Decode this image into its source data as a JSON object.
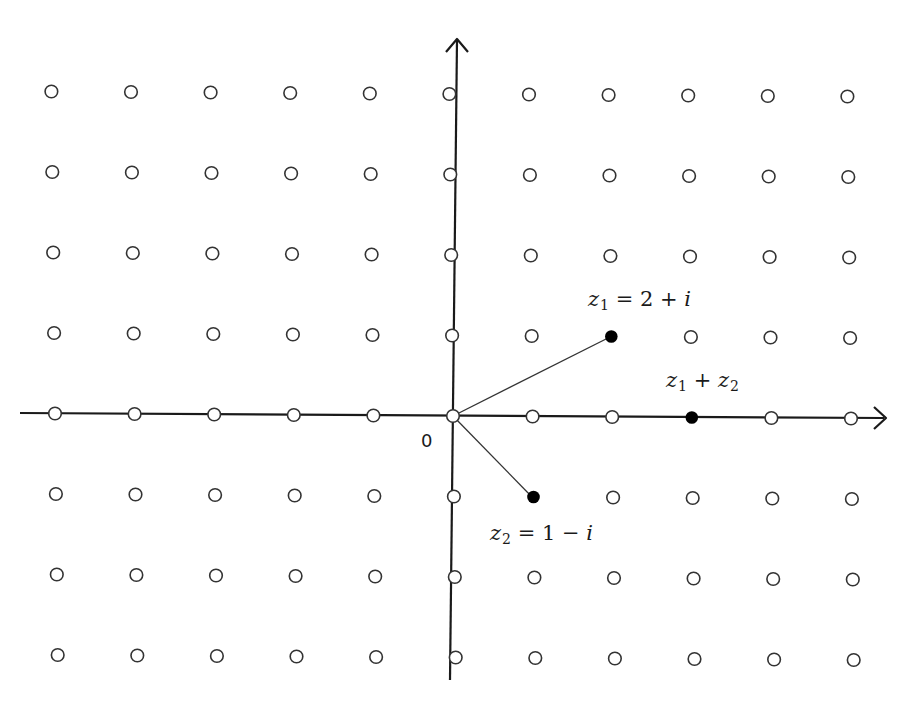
{
  "diagram": {
    "origin_label": "0",
    "lattice": {
      "x_range": [
        -5,
        5
      ],
      "y_range": [
        -3,
        4
      ],
      "point_style": "open-circle"
    },
    "highlighted_points": [
      {
        "id": "z1",
        "re": 2,
        "im": 1,
        "label": "z1 = 2 + i",
        "label_parts": {
          "var": "z",
          "sub": "1",
          "rest": " = 2 + ",
          "tail": "i"
        }
      },
      {
        "id": "z2",
        "re": 1,
        "im": -1,
        "label": "z2 = 1 − i",
        "label_parts": {
          "var": "z",
          "sub": "2",
          "rest": " = 1 − ",
          "tail": "i"
        }
      },
      {
        "id": "sum",
        "re": 3,
        "im": 0,
        "label": "z1 + z2",
        "label_parts": {
          "var1": "z",
          "sub1": "1",
          "op": " + ",
          "var2": "z",
          "sub2": "2"
        }
      }
    ],
    "segments": [
      {
        "from": "origin",
        "to": "z1"
      },
      {
        "from": "origin",
        "to": "z2"
      }
    ],
    "axes": {
      "horizontal_arrow": true,
      "vertical_arrow": true
    }
  },
  "colors": {
    "background": "#ffffff",
    "ink": "#1a1a1a",
    "open_point_stroke": "#333333",
    "filled_point": "#000000"
  }
}
